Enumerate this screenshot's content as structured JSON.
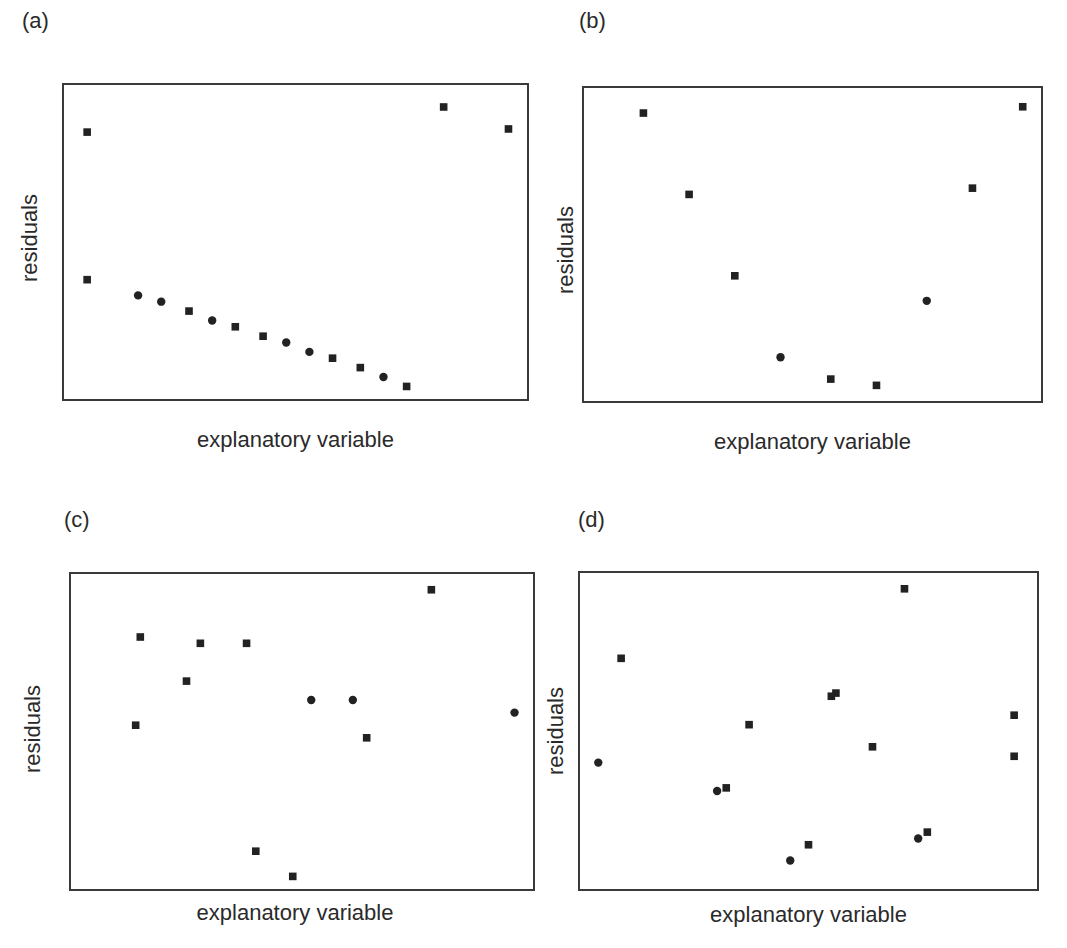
{
  "figure": {
    "marker_color": "#222222",
    "frame_color": "#3a3a3a"
  },
  "chart_data": [
    {
      "type": "scatter",
      "panel": "(a)",
      "title": "(a)",
      "xlabel": "explanatory variable",
      "ylabel": "residuals",
      "grid": false,
      "ticks": false,
      "xlim": [
        0,
        100
      ],
      "ylim": [
        0,
        100
      ],
      "points": [
        {
          "x": 5,
          "y": 85,
          "marker": "square"
        },
        {
          "x": 5,
          "y": 38,
          "marker": "square"
        },
        {
          "x": 16,
          "y": 33,
          "marker": "circle"
        },
        {
          "x": 21,
          "y": 31,
          "marker": "circle"
        },
        {
          "x": 27,
          "y": 28,
          "marker": "square"
        },
        {
          "x": 32,
          "y": 25,
          "marker": "circle"
        },
        {
          "x": 37,
          "y": 23,
          "marker": "square"
        },
        {
          "x": 43,
          "y": 20,
          "marker": "square"
        },
        {
          "x": 48,
          "y": 18,
          "marker": "circle"
        },
        {
          "x": 53,
          "y": 15,
          "marker": "circle"
        },
        {
          "x": 58,
          "y": 13,
          "marker": "square"
        },
        {
          "x": 64,
          "y": 10,
          "marker": "square"
        },
        {
          "x": 69,
          "y": 7,
          "marker": "circle"
        },
        {
          "x": 74,
          "y": 4,
          "marker": "square"
        },
        {
          "x": 82,
          "y": 93,
          "marker": "square"
        },
        {
          "x": 96,
          "y": 86,
          "marker": "square"
        }
      ]
    },
    {
      "type": "scatter",
      "panel": "(b)",
      "title": "(b)",
      "xlabel": "explanatory variable",
      "ylabel": "residuals",
      "grid": false,
      "ticks": false,
      "xlim": [
        0,
        100
      ],
      "ylim": [
        0,
        100
      ],
      "points": [
        {
          "x": 13,
          "y": 92,
          "marker": "square"
        },
        {
          "x": 23,
          "y": 66,
          "marker": "square"
        },
        {
          "x": 33,
          "y": 40,
          "marker": "square"
        },
        {
          "x": 43,
          "y": 14,
          "marker": "circle"
        },
        {
          "x": 54,
          "y": 7,
          "marker": "square"
        },
        {
          "x": 64,
          "y": 5,
          "marker": "square"
        },
        {
          "x": 75,
          "y": 32,
          "marker": "circle"
        },
        {
          "x": 85,
          "y": 68,
          "marker": "square"
        },
        {
          "x": 96,
          "y": 94,
          "marker": "square"
        }
      ]
    },
    {
      "type": "scatter",
      "panel": "(c)",
      "title": "(c)",
      "xlabel": "explanatory variable",
      "ylabel": "residuals",
      "grid": false,
      "ticks": false,
      "xlim": [
        0,
        100
      ],
      "ylim": [
        0,
        100
      ],
      "points": [
        {
          "x": 14,
          "y": 52,
          "marker": "square"
        },
        {
          "x": 15,
          "y": 80,
          "marker": "square"
        },
        {
          "x": 25,
          "y": 66,
          "marker": "square"
        },
        {
          "x": 28,
          "y": 78,
          "marker": "square"
        },
        {
          "x": 38,
          "y": 78,
          "marker": "square"
        },
        {
          "x": 40,
          "y": 12,
          "marker": "square"
        },
        {
          "x": 48,
          "y": 4,
          "marker": "square"
        },
        {
          "x": 52,
          "y": 60,
          "marker": "circle"
        },
        {
          "x": 61,
          "y": 60,
          "marker": "circle"
        },
        {
          "x": 64,
          "y": 48,
          "marker": "square"
        },
        {
          "x": 78,
          "y": 95,
          "marker": "square"
        },
        {
          "x": 96,
          "y": 56,
          "marker": "circle"
        }
      ]
    },
    {
      "type": "scatter",
      "panel": "(d)",
      "title": "(d)",
      "xlabel": "explanatory variable",
      "ylabel": "residuals",
      "grid": false,
      "ticks": false,
      "xlim": [
        0,
        100
      ],
      "ylim": [
        0,
        100
      ],
      "points": [
        {
          "x": 4,
          "y": 40,
          "marker": "circle"
        },
        {
          "x": 9,
          "y": 73,
          "marker": "square"
        },
        {
          "x": 30,
          "y": 31,
          "marker": "circle"
        },
        {
          "x": 32,
          "y": 32,
          "marker": "square"
        },
        {
          "x": 37,
          "y": 52,
          "marker": "square"
        },
        {
          "x": 46,
          "y": 9,
          "marker": "circle"
        },
        {
          "x": 50,
          "y": 14,
          "marker": "square"
        },
        {
          "x": 55,
          "y": 61,
          "marker": "square"
        },
        {
          "x": 56,
          "y": 62,
          "marker": "square"
        },
        {
          "x": 64,
          "y": 45,
          "marker": "square"
        },
        {
          "x": 71,
          "y": 95,
          "marker": "square"
        },
        {
          "x": 74,
          "y": 16,
          "marker": "circle"
        },
        {
          "x": 76,
          "y": 18,
          "marker": "square"
        },
        {
          "x": 95,
          "y": 55,
          "marker": "square"
        },
        {
          "x": 95,
          "y": 42,
          "marker": "square"
        }
      ]
    }
  ],
  "panels": [
    {
      "label": "(a)",
      "xlabel": "explanatory variable",
      "ylabel": "residuals"
    },
    {
      "label": "(b)",
      "xlabel": "explanatory variable",
      "ylabel": "residuals"
    },
    {
      "label": "(c)",
      "xlabel": "explanatory variable",
      "ylabel": "residuals"
    },
    {
      "label": "(d)",
      "xlabel": "explanatory variable",
      "ylabel": "residuals"
    }
  ]
}
